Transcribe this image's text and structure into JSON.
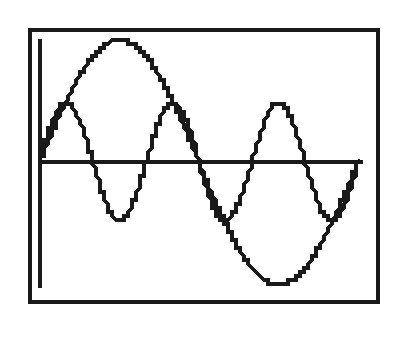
{
  "chart_data": {
    "type": "line",
    "title": "",
    "xlabel": "",
    "ylabel": "",
    "grid": false,
    "legend": null,
    "xlim": [
      0,
      6.2832
    ],
    "ylim": [
      -1.05,
      1.05
    ],
    "series": [
      {
        "name": "y = sin(x)",
        "function": "sin(x)",
        "amplitude": 1,
        "frequency": 1,
        "color": "#1a1a1a"
      },
      {
        "name": "y = 0.48 sin(3x)",
        "function": "0.48*sin(3x)",
        "amplitude": 0.48,
        "frequency": 3,
        "color": "#1a1a1a"
      }
    ],
    "key_points": {
      "sin(x)": [
        [
          0,
          0
        ],
        [
          1.5708,
          1
        ],
        [
          3.1416,
          0
        ],
        [
          4.7124,
          -1
        ],
        [
          6.2832,
          0
        ]
      ],
      "0.48 sin(3x)": [
        [
          0,
          0
        ],
        [
          0.5236,
          0.48
        ],
        [
          1.0472,
          0
        ],
        [
          1.5708,
          -0.48
        ],
        [
          2.0944,
          0
        ],
        [
          2.618,
          0.48
        ],
        [
          3.1416,
          0
        ],
        [
          3.6652,
          -0.48
        ],
        [
          4.1888,
          0
        ],
        [
          4.7124,
          0.48
        ],
        [
          5.236,
          0
        ],
        [
          5.7596,
          -0.48
        ],
        [
          6.2832,
          0
        ]
      ]
    }
  },
  "display": {
    "frame_color": "#1a1a1a",
    "background": "#ffffff",
    "style": "pixelated graphing calculator screen"
  }
}
